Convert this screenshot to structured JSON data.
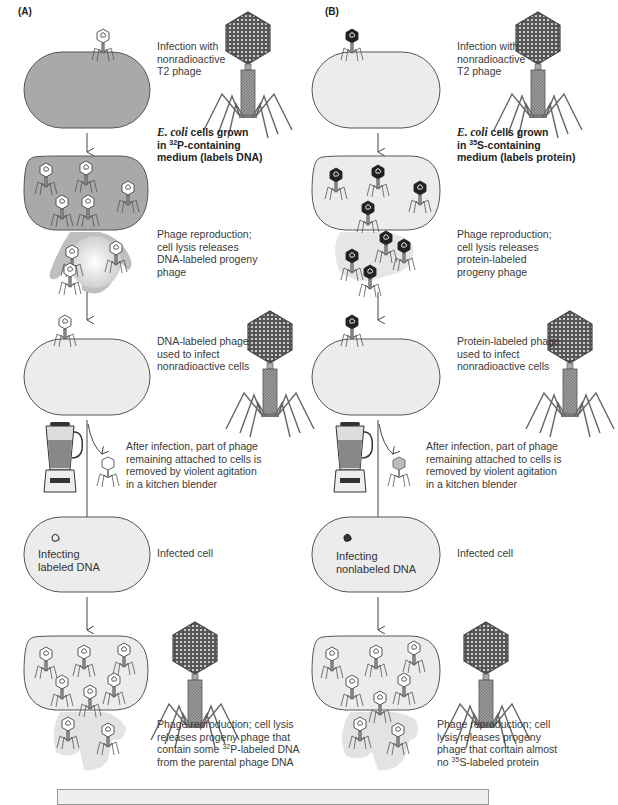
{
  "figure": {
    "panels": [
      {
        "label": "(A)",
        "steps": {
          "infection": "Infection with nonradioactive T2 phage",
          "infection_lines": [
            "Infection with",
            "nonradioactive",
            "T2 phage"
          ],
          "growth_line1_italic": "E. coli",
          "growth_line1_rest": " cells grown",
          "growth_line2_pre": "in ",
          "growth_isotope_mass": "32",
          "growth_line2_post": "P-containing",
          "growth_line3": "medium (labels DNA)",
          "reproduction_lines": [
            "Phage reproduction;",
            "cell lysis releases",
            "DNA-labeled progeny",
            "phage"
          ],
          "labeled_phage_lines": [
            "DNA-labeled phage",
            "used to infect",
            "nonradioactive cells"
          ],
          "blender_lines": [
            "After infection, part of phage",
            "remaining attached to cells is",
            "removed by violent agitation",
            "in a kitchen blender"
          ],
          "infected_cell_inner_lines": [
            "Infecting",
            "labeled DNA"
          ],
          "infected_cell_label": "Infected cell",
          "final_line1": "Phage reproduction; cell lysis",
          "final_line2": "releases progeny phage that",
          "final_line3_pre": "contain some ",
          "final_isotope_mass": "32",
          "final_line3_post": "P-labeled DNA",
          "final_line4": "from the parental phage DNA"
        },
        "colors": {
          "labeled_cell_fill": "#a9a9a9",
          "cell_fill": "#ececec"
        }
      },
      {
        "label": "(B)",
        "steps": {
          "infection_lines": [
            "Infection with",
            "nonradioactive",
            "T2 phage"
          ],
          "growth_line1_italic": "E. coli",
          "growth_line1_rest": " cells grown",
          "growth_line2_pre": "in ",
          "growth_isotope_mass": "35",
          "growth_line2_post": "S-containing",
          "growth_line3": "medium (labels protein)",
          "reproduction_lines": [
            "Phage reproduction;",
            "cell lysis releases",
            "protein-labeled",
            "progeny phage"
          ],
          "labeled_phage_lines": [
            "Protein-labeled phage",
            "used to infect",
            "nonradioactive cells"
          ],
          "blender_lines": [
            "After infection, part of phage",
            "remaining attached to cells is",
            "removed by violent agitation",
            "in a kitchen blender"
          ],
          "infected_cell_inner_lines": [
            "Infecting",
            "nonlabeled DNA"
          ],
          "infected_cell_label": "Infected cell",
          "final_line1": "Phage reproduction; cell",
          "final_line2": "lysis releases progeny",
          "final_line3": "phage that contain almost",
          "final_line4_pre": "no ",
          "final_isotope_mass": "35",
          "final_line4_post": "S-labeled protein"
        },
        "colors": {
          "labeled_cell_fill": "#ececec",
          "cell_fill": "#ececec"
        }
      }
    ],
    "icons": [
      "t2-phage-icon",
      "bacterial-cell-icon",
      "blender-icon",
      "down-arrow-icon",
      "curved-arrow-icon",
      "phage-ghost-icon"
    ],
    "caption_box": {
      "text": ""
    }
  }
}
